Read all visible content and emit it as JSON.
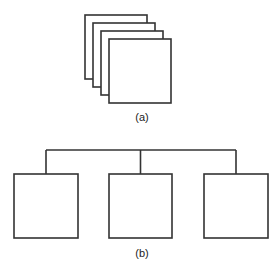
{
  "diagram": {
    "stroke_color": "#333333",
    "background": "#ffffff",
    "part_a": {
      "label": "(a)",
      "description": "Four stacked overlapping squares (cascade)",
      "squares": [
        {
          "x": 85,
          "y": 15,
          "w": 62,
          "h": 64
        },
        {
          "x": 93,
          "y": 23,
          "w": 62,
          "h": 64
        },
        {
          "x": 101,
          "y": 31,
          "w": 62,
          "h": 64
        },
        {
          "x": 109,
          "y": 39,
          "w": 62,
          "h": 64
        }
      ]
    },
    "part_b": {
      "label": "(b)",
      "description": "Three squares connected to a common horizontal bus line",
      "bus": {
        "x1": 46,
        "x2": 236,
        "y": 150
      },
      "squares": [
        {
          "x": 14,
          "y": 174,
          "w": 64,
          "h": 64
        },
        {
          "x": 109,
          "y": 174,
          "w": 63,
          "h": 64
        },
        {
          "x": 204,
          "y": 174,
          "w": 64,
          "h": 64
        }
      ]
    }
  }
}
